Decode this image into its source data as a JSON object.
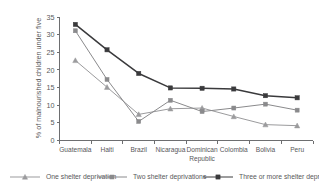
{
  "chart_data": {
    "type": "line",
    "title": "",
    "xlabel": "",
    "ylabel": "% of malnourished children under five",
    "ylim": [
      0,
      35
    ],
    "yticks": [
      0,
      5,
      10,
      15,
      20,
      25,
      30,
      35
    ],
    "grid": false,
    "legend_position": "bottom",
    "categories": [
      "Guatemala",
      "Haiti",
      "Brazil",
      "Nicaragua",
      "Dominican Republic",
      "Colombia",
      "Bolivia",
      "Peru"
    ],
    "category_lines": [
      [
        "Guatemala"
      ],
      [
        "Haiti"
      ],
      [
        "Brazil"
      ],
      [
        "Nicaragua"
      ],
      [
        "Dominican",
        "Republic"
      ],
      [
        "Colombia"
      ],
      [
        "Bolivia"
      ],
      [
        "Peru"
      ]
    ],
    "series": [
      {
        "name": "One shelter deprivation",
        "marker": "triangle",
        "color": "#9b9b9d",
        "values": [
          22.7,
          15.1,
          7.4,
          9.0,
          9.2,
          6.8,
          4.5,
          4.2
        ]
      },
      {
        "name": "Two shelter deprivations",
        "marker": "square",
        "color": "#8a8a8c",
        "values": [
          31.1,
          17.3,
          5.4,
          11.4,
          8.2,
          9.2,
          10.3,
          8.6
        ]
      },
      {
        "name": "Three or more shelter deprivations",
        "marker": "square-filled",
        "color": "#3a3a3c",
        "values": [
          32.9,
          25.7,
          19.0,
          14.9,
          14.8,
          14.6,
          12.7,
          12.1
        ]
      }
    ]
  },
  "axis": {
    "ylabel": "% of malnourished children under five",
    "ytick_labels": [
      "0",
      "5",
      "10",
      "15",
      "20",
      "25",
      "30",
      "35"
    ]
  },
  "legend": {
    "items": [
      {
        "label": "One shelter deprivation"
      },
      {
        "label": "Two shelter deprivations"
      },
      {
        "label": "Three or more shelter deprivations"
      }
    ]
  },
  "colors": {
    "axis": "#6d6e70",
    "text": "#58585a",
    "series_one": "#9b9b9d",
    "series_two": "#8a8a8c",
    "series_three": "#3a3a3c",
    "background": "#ffffff"
  }
}
